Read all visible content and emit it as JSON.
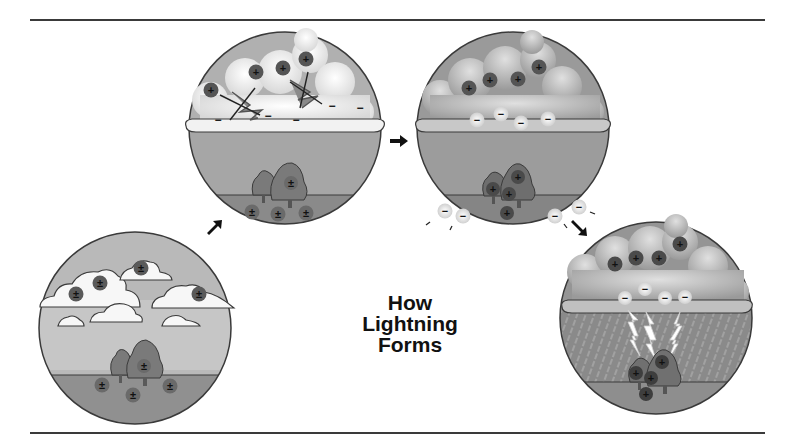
{
  "title": {
    "lines": [
      "How",
      "Lightning",
      "Forms"
    ]
  },
  "colors": {
    "sky_light": "#b9b9b9",
    "ground": "#8c8c8c",
    "circle_outline": "#3a3a3a",
    "positive_charge": "#555555",
    "negative_charge": "#efefef",
    "cloud": "#f4f4f4",
    "tree": "#7a7a7a"
  },
  "stages": [
    {
      "id": 1,
      "description": "Fair-weather clouds; neutral charges in clouds and ground",
      "cloud_charges": [
        "±",
        "±",
        "±",
        "±"
      ],
      "ground_charges": [
        "±",
        "±",
        "±",
        "±"
      ]
    },
    {
      "id": 2,
      "description": "Storm cloud forms; ice collisions separate charges",
      "cloud_positive": [
        "+",
        "+",
        "+",
        "+"
      ],
      "cloud_negative": [
        "−",
        "−",
        "−",
        "−",
        "−"
      ],
      "ground_charges": [
        "±",
        "±",
        "±",
        "±"
      ]
    },
    {
      "id": 3,
      "description": "Positive charges rise to cloud top, negatives at bottom; ground becomes positive",
      "cloud_positive": [
        "+",
        "+",
        "+",
        "+"
      ],
      "cloud_negative": [
        "−",
        "−",
        "−",
        "−"
      ],
      "ground_positive": [
        "+",
        "+",
        "+",
        "+"
      ],
      "escaping_negative": [
        "−",
        "−",
        "−",
        "−"
      ]
    },
    {
      "id": 4,
      "description": "Lightning discharge between cloud base and ground with rain",
      "cloud_positive": [
        "+",
        "+",
        "+",
        "+"
      ],
      "cloud_negative": [
        "−",
        "−",
        "−",
        "−"
      ],
      "ground_positive": [
        "+",
        "+",
        "+",
        "+"
      ]
    }
  ],
  "arrows": [
    "stage1-to-stage2",
    "stage2-to-stage3",
    "stage3-to-stage4"
  ]
}
